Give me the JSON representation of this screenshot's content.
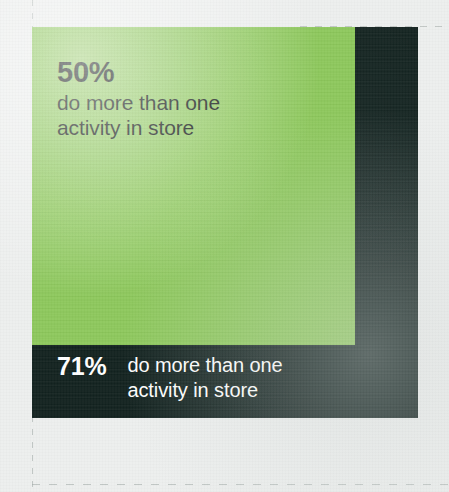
{
  "colors": {
    "background": "#edefee",
    "green_panel": "#8cc75a",
    "dark_panel": "#11211e",
    "dark_text": "#0e1412",
    "light_text": "#ffffff",
    "guide_line": "#9aa3a0"
  },
  "green_panel": {
    "stat": "50%",
    "description": "do more than one\nactivity in store"
  },
  "dark_caption": {
    "stat": "71%",
    "description": "do more than one\nactivity in store"
  },
  "chart_data": {
    "type": "bar",
    "title": "",
    "categories": [
      "71%",
      "50%"
    ],
    "values": [
      71,
      50
    ],
    "labels": [
      "do more than one activity in store",
      "do more than one activity in store"
    ],
    "xlabel": "",
    "ylabel": "",
    "ylim": [
      0,
      100
    ],
    "grid": false,
    "legend": "none"
  }
}
